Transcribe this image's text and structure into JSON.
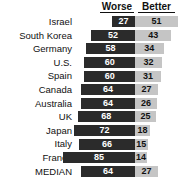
{
  "chart_data": {
    "type": "bar",
    "title": "",
    "subtitle": "",
    "xlabel": "",
    "ylabel": "",
    "orientation": "horizontal",
    "layout": "diverging-bidirectional",
    "grid": false,
    "legend_position": "top",
    "axis_origin_label": "0",
    "categories": [
      "Israel",
      "South Korea",
      "Germany",
      "U.S.",
      "Spain",
      "Canada",
      "Australia",
      "UK",
      "Japan",
      "Italy",
      "France",
      "MEDIAN"
    ],
    "series": [
      {
        "name": "Worse",
        "color": "#2b2b2b",
        "direction": "left",
        "values": [
          27,
          52,
          58,
          60,
          60,
          64,
          64,
          68,
          72,
          66,
          85,
          64
        ]
      },
      {
        "name": "Better",
        "color": "#c5c5c5",
        "direction": "right",
        "values": [
          51,
          43,
          34,
          32,
          31,
          27,
          26,
          25,
          18,
          15,
          14,
          27
        ]
      }
    ],
    "xlim": [
      0,
      90
    ],
    "units": "percent"
  },
  "header": {
    "worse_label": "Worse",
    "better_label": "Better"
  },
  "colors": {
    "worse": "#2b2b2b",
    "better": "#c5c5c5",
    "background": "#ffffff",
    "text": "#111111"
  }
}
